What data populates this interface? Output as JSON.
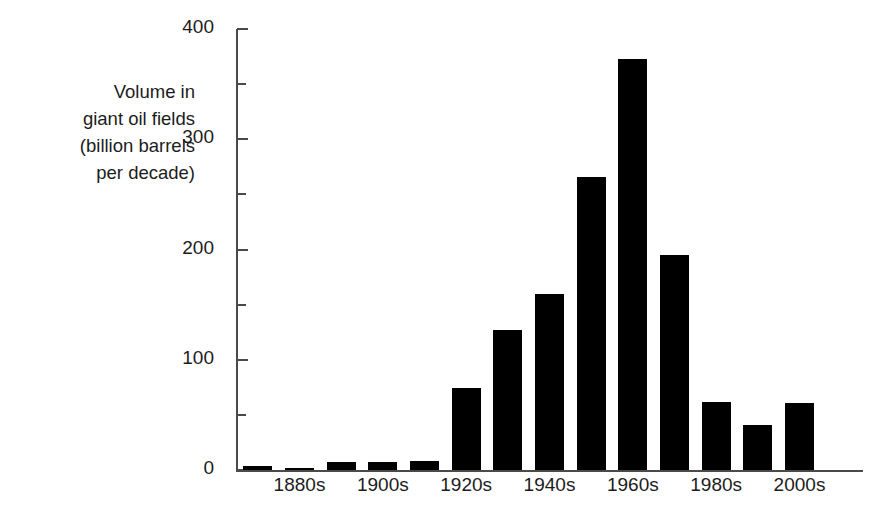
{
  "chart_data": {
    "type": "bar",
    "title": "",
    "xlabel": "",
    "ylabel": "Volume in\ngiant oil fields\n(billion barrels\nper decade)",
    "ylabel_lines": [
      "Volume in",
      "giant oil fields",
      "(billion barrels",
      "per decade)"
    ],
    "categories": [
      "1870s",
      "1880s",
      "1890s",
      "1900s",
      "1910s",
      "1920s",
      "1930s",
      "1940s",
      "1950s",
      "1960s",
      "1970s",
      "1980s",
      "1990s",
      "2000s",
      "2010s"
    ],
    "values": [
      4,
      1,
      7,
      7,
      8,
      74,
      127,
      160,
      266,
      373,
      195,
      62,
      41,
      61,
      0
    ],
    "ylim": [
      0,
      400
    ],
    "xlim_note": "15 decade bins, every other decade labeled",
    "yticks_major": [
      0,
      100,
      200,
      300,
      400
    ],
    "yticks_minor": [
      50,
      150,
      250,
      350
    ],
    "ytick_labels": [
      "0",
      "100",
      "200",
      "300",
      "400"
    ],
    "xtick_labels": [
      "1880s",
      "1900s",
      "1920s",
      "1940s",
      "1960s",
      "1980s",
      "2000s"
    ],
    "xtick_categories": [
      "1880s",
      "1900s",
      "1920s",
      "1940s",
      "1960s",
      "1980s",
      "2000s"
    ],
    "grid": false,
    "legend": null,
    "bar_color": "#000000",
    "axis_color": "#4a4a4a",
    "text_color": "#1c1c1c",
    "background_color": "#ffffff"
  }
}
